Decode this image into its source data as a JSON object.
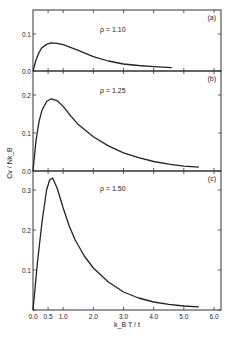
{
  "figure": {
    "ylabel": "Cv / Nk_B",
    "xlabel": "k_B T / t"
  },
  "chart_data": [
    {
      "type": "line",
      "panel_label": "(a)",
      "annotation": "ρ = 1.10",
      "xlabel": "k_B T / t",
      "ylabel": "C_v / N k_B",
      "xlim": [
        0.0,
        6.0
      ],
      "ylim": [
        0.0,
        0.1
      ],
      "yticks": [
        0.0,
        0.1
      ],
      "ytick_labels": [
        "0.0",
        "0.1"
      ],
      "grid": false,
      "x": [
        0.0,
        0.1,
        0.2,
        0.3,
        0.45,
        0.6,
        0.8,
        1.0,
        1.5,
        2.0,
        2.5,
        3.0,
        3.5,
        4.0,
        4.6
      ],
      "y": [
        0.0,
        0.03,
        0.05,
        0.063,
        0.072,
        0.076,
        0.075,
        0.071,
        0.056,
        0.039,
        0.027,
        0.019,
        0.015,
        0.012,
        0.009
      ]
    },
    {
      "type": "line",
      "panel_label": "(b)",
      "annotation": "ρ = 1.25",
      "xlabel": "k_B T / t",
      "ylabel": "C_v / N k_B",
      "xlim": [
        0.0,
        6.0
      ],
      "ylim": [
        0.0,
        0.2
      ],
      "yticks": [
        0.0,
        0.1,
        0.2
      ],
      "ytick_labels": [
        "0.0",
        "0.1",
        "0.2"
      ],
      "grid": false,
      "x": [
        0.0,
        0.1,
        0.2,
        0.3,
        0.45,
        0.6,
        0.8,
        1.0,
        1.25,
        1.5,
        2.0,
        2.5,
        3.0,
        3.5,
        4.0,
        4.5,
        5.0,
        5.5
      ],
      "y": [
        0.0,
        0.08,
        0.13,
        0.16,
        0.183,
        0.19,
        0.185,
        0.17,
        0.145,
        0.122,
        0.09,
        0.066,
        0.048,
        0.035,
        0.025,
        0.018,
        0.013,
        0.01
      ]
    },
    {
      "type": "line",
      "panel_label": "(c)",
      "annotation": "ρ = 1.50",
      "xlabel": "k_B T / t",
      "ylabel": "C_v / N k_B",
      "xlim": [
        0.0,
        6.0
      ],
      "ylim": [
        0.0,
        0.33
      ],
      "yticks": [
        0.0,
        0.1,
        0.2,
        0.3
      ],
      "ytick_labels": [
        "",
        "0.1",
        "0.2",
        "0.3"
      ],
      "xticks": [
        0.0,
        0.5,
        1.0,
        2.0,
        3.0,
        4.0,
        5.0,
        6.0
      ],
      "xtick_labels": [
        "0.0",
        "0.5",
        "1.0",
        "2.0",
        "3.0",
        "4.0",
        "5.0",
        "6.0"
      ],
      "grid": false,
      "x": [
        0.0,
        0.15,
        0.3,
        0.45,
        0.55,
        0.65,
        0.8,
        1.0,
        1.2,
        1.4,
        1.7,
        2.0,
        2.5,
        3.0,
        3.5,
        4.0,
        4.5,
        5.0,
        5.5
      ],
      "y": [
        0.0,
        0.12,
        0.22,
        0.3,
        0.325,
        0.33,
        0.305,
        0.255,
        0.21,
        0.175,
        0.135,
        0.105,
        0.07,
        0.045,
        0.03,
        0.02,
        0.014,
        0.01,
        0.008
      ]
    }
  ]
}
